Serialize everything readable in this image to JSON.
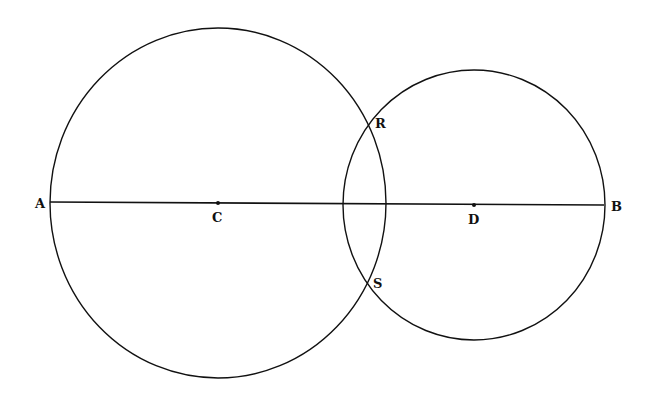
{
  "diagram": {
    "stroke_color": "#111111",
    "background": "#ffffff",
    "circles": [
      {
        "name": "circle-centered-at-C",
        "center": "C",
        "cx": 218,
        "cy": 203,
        "rx": 168,
        "ry": 175
      },
      {
        "name": "circle-centered-at-D",
        "center": "D",
        "cx": 474,
        "cy": 205,
        "rx": 131,
        "ry": 135
      }
    ],
    "segment": {
      "from": "A",
      "to": "B",
      "x1": 50,
      "y1": 202,
      "x2": 604,
      "y2": 205
    },
    "points": [
      {
        "id": "A",
        "label": "A",
        "x": 50,
        "y": 202,
        "lx": 35,
        "ly": 208,
        "dot": false
      },
      {
        "id": "C",
        "label": "C",
        "x": 218,
        "y": 203,
        "lx": 212,
        "ly": 222,
        "dot": true
      },
      {
        "id": "R",
        "label": "R",
        "x": 368,
        "y": 124,
        "lx": 375,
        "ly": 128,
        "dot": false
      },
      {
        "id": "S",
        "label": "S",
        "x": 367,
        "y": 282,
        "lx": 373,
        "ly": 288,
        "dot": false
      },
      {
        "id": "D",
        "label": "D",
        "x": 474,
        "y": 205,
        "lx": 468,
        "ly": 224,
        "dot": true
      },
      {
        "id": "B",
        "label": "B",
        "x": 604,
        "y": 205,
        "lx": 611,
        "ly": 211,
        "dot": false
      }
    ]
  }
}
